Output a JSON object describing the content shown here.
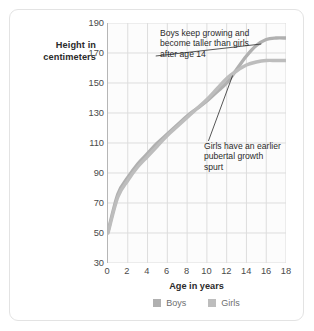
{
  "axis": {
    "y_caption_line1": "Height in",
    "y_caption_line2": "centimeters",
    "x_caption": "Age in years"
  },
  "annotations": {
    "boys": "Boys keep growing and become taller than girls after age 14",
    "girls": "Girls have an earlier pubertal growth spurt"
  },
  "legend": {
    "boys_label": "Boys",
    "girls_label": "Girls",
    "boys_color": "#b0b0b0",
    "girls_color": "#bdbdbd"
  },
  "colors": {
    "grid": "#dddddd",
    "axis": "#b6b6b6",
    "plot_bg": "#fcfcfc",
    "card_border": "#e3e3e3",
    "text": "#2b2b2b",
    "tick_text": "#4a4a4a"
  },
  "chart_data": {
    "type": "line",
    "title": "",
    "xlabel": "Age in years",
    "ylabel": "Height in centimeters",
    "xlim": [
      0,
      18
    ],
    "ylim": [
      30,
      190
    ],
    "xticks": [
      0,
      2,
      4,
      6,
      8,
      10,
      12,
      14,
      16,
      18
    ],
    "yticks": [
      30,
      50,
      70,
      90,
      110,
      130,
      150,
      170,
      190
    ],
    "grid": true,
    "legend_position": "bottom",
    "x": [
      0,
      1,
      2,
      3,
      4,
      5,
      6,
      7,
      8,
      9,
      10,
      11,
      12,
      13,
      14,
      15,
      16,
      17,
      18
    ],
    "series": [
      {
        "name": "Boys",
        "color": "#b0b0b0",
        "values": [
          51,
          76,
          87,
          96,
          103,
          110,
          116,
          122,
          128,
          133,
          138,
          144,
          150,
          159,
          168,
          175,
          179,
          180,
          180
        ]
      },
      {
        "name": "Girls",
        "color": "#bdbdbd",
        "values": [
          50,
          74,
          85,
          94,
          101,
          108,
          115,
          121,
          127,
          133,
          139,
          146,
          153,
          158,
          162,
          164,
          165,
          165,
          165
        ]
      }
    ],
    "annotations": [
      {
        "text": "Boys keep growing and become taller than girls after age 14",
        "points_to_series": "Boys",
        "points_to_x": 15.5,
        "points_to_y": 176
      },
      {
        "text": "Girls have an earlier pubertal growth spurt",
        "points_to_series": "Girls",
        "points_to_x": 12.6,
        "points_to_y": 155
      }
    ]
  }
}
